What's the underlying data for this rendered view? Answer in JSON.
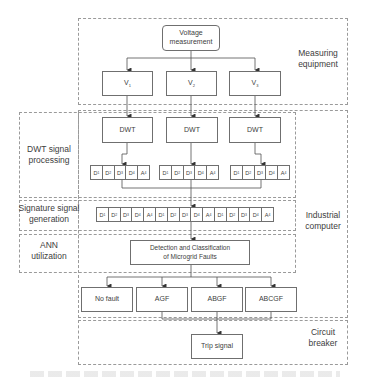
{
  "diagram": {
    "regions": {
      "measuring": "Measuring\nequipment",
      "industrial": "Industrial\ncomputer",
      "dwt_processing": "DWT signal\nprocessing",
      "signature": "Signature signal\ngeneration",
      "ann": "ANN\nutilization",
      "breaker": "Circuit\nbreaker"
    },
    "nodes": {
      "voltage": "Voltage\nmeasurement",
      "v1": "V1",
      "v2": "V2",
      "v3": "V3",
      "dwt1": "DWT",
      "dwt2": "DWT",
      "dwt3": "DWT",
      "detection": "Detection and Classification\nof Microgrid Faults",
      "no_fault": "No fault",
      "agf": "AGF",
      "abgf": "ABGF",
      "abcgf": "ABCGF",
      "trip": "Trip signal"
    },
    "coefficient_group": [
      "D1",
      "D2",
      "D3",
      "D4",
      "A4"
    ],
    "signature_vector": [
      "D1",
      "D2",
      "D3",
      "D4",
      "A4",
      "D1",
      "D2",
      "D3",
      "D4",
      "A4",
      "D1",
      "D2",
      "D3",
      "D4",
      "A4"
    ],
    "colors": {
      "line": "#505050",
      "box_border": "#6f6f6f",
      "dashed": "#9a9a9a",
      "text": "#404040"
    }
  }
}
